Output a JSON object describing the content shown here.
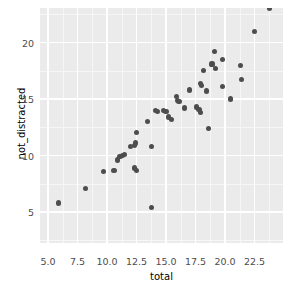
{
  "chart_data": {
    "type": "scatter",
    "title": "",
    "xlabel": "total",
    "ylabel": "not_distracted",
    "xlim": [
      4.1,
      24.4
    ],
    "ylim": [
      1.5,
      24.2
    ],
    "grid": true,
    "legend": null,
    "xticks": [
      "5.0",
      "7.5",
      "10.0",
      "12.5",
      "15.0",
      "17.5",
      "20.0",
      "22.5"
    ],
    "xtick_values": [
      5.0,
      7.5,
      10.0,
      12.5,
      15.0,
      17.5,
      20.0,
      22.5
    ],
    "yticks": [
      "5",
      "10",
      "15",
      "20"
    ],
    "ytick_values": [
      5,
      10,
      15,
      20
    ],
    "point_color": "#4d4d4d",
    "panel_color": "#ebebeb",
    "gridline_color": "#ffffff",
    "points": [
      {
        "x": 5.9,
        "y": 5.8
      },
      {
        "x": 8.2,
        "y": 7.1
      },
      {
        "x": 9.7,
        "y": 8.6
      },
      {
        "x": 10.6,
        "y": 8.7
      },
      {
        "x": 10.9,
        "y": 9.6
      },
      {
        "x": 11.1,
        "y": 9.9
      },
      {
        "x": 11.3,
        "y": 10.0
      },
      {
        "x": 11.5,
        "y": 10.1
      },
      {
        "x": 12.0,
        "y": 10.8
      },
      {
        "x": 12.3,
        "y": 10.9
      },
      {
        "x": 12.4,
        "y": 11.1
      },
      {
        "x": 12.3,
        "y": 8.9
      },
      {
        "x": 12.5,
        "y": 8.7
      },
      {
        "x": 12.5,
        "y": 12.0
      },
      {
        "x": 13.4,
        "y": 13.0
      },
      {
        "x": 13.8,
        "y": 10.8
      },
      {
        "x": 13.8,
        "y": 5.4
      },
      {
        "x": 14.1,
        "y": 14.0
      },
      {
        "x": 14.3,
        "y": 13.9
      },
      {
        "x": 14.8,
        "y": 14.0
      },
      {
        "x": 15.0,
        "y": 13.9
      },
      {
        "x": 15.2,
        "y": 13.4
      },
      {
        "x": 15.5,
        "y": 13.2
      },
      {
        "x": 15.9,
        "y": 15.2
      },
      {
        "x": 16.0,
        "y": 14.9
      },
      {
        "x": 16.1,
        "y": 14.8
      },
      {
        "x": 16.6,
        "y": 14.2
      },
      {
        "x": 17.0,
        "y": 15.8
      },
      {
        "x": 17.4,
        "y": 1.9
      },
      {
        "x": 17.6,
        "y": 14.3
      },
      {
        "x": 17.8,
        "y": 14.1
      },
      {
        "x": 17.9,
        "y": 13.8
      },
      {
        "x": 17.9,
        "y": 16.4
      },
      {
        "x": 18.0,
        "y": 16.2
      },
      {
        "x": 18.2,
        "y": 17.5
      },
      {
        "x": 18.4,
        "y": 15.7
      },
      {
        "x": 18.6,
        "y": 12.4
      },
      {
        "x": 18.9,
        "y": 18.1
      },
      {
        "x": 19.1,
        "y": 19.2
      },
      {
        "x": 19.2,
        "y": 17.7
      },
      {
        "x": 19.8,
        "y": 18.5
      },
      {
        "x": 19.8,
        "y": 16.1
      },
      {
        "x": 20.5,
        "y": 15.0
      },
      {
        "x": 21.3,
        "y": 18.0
      },
      {
        "x": 21.4,
        "y": 16.7
      },
      {
        "x": 22.5,
        "y": 21.0
      },
      {
        "x": 23.8,
        "y": 23.5
      },
      {
        "x": 23.8,
        "y": 23.0
      }
    ]
  },
  "axes": {
    "x_title": "total",
    "y_title": "not_distracted"
  }
}
